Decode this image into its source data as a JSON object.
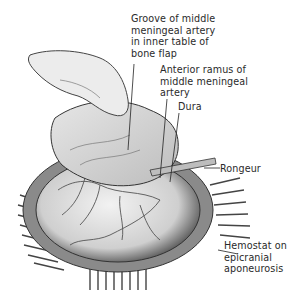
{
  "figure": {
    "type": "anatomical illustration",
    "colors": {
      "ink": "#2a2a2a",
      "background": "#ffffff",
      "dura": "#d8d8d8",
      "shadow": "#555555"
    }
  },
  "labels": [
    {
      "id": "groove",
      "text": "Groove of middle\nmeningeal artery\nin inner table of\nbone flap"
    },
    {
      "id": "anterior-ramus",
      "text": "Anterior ramus of\nmiddle meningeal\nartery"
    },
    {
      "id": "dura",
      "text": "Dura"
    },
    {
      "id": "rongeur",
      "text": "Rongeur"
    },
    {
      "id": "hemostat",
      "text": "Hemostat on\nepicranial\naponeurosis"
    }
  ]
}
